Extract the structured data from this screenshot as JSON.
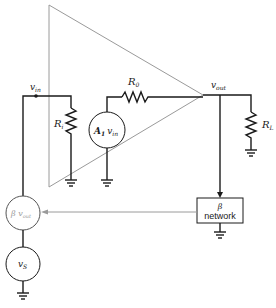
{
  "diagram": {
    "type": "feedback-amplifier-circuit",
    "colors": {
      "wire": "#1a1a1a",
      "amplifier_outline": "#9a9a9a",
      "feedback_path": "#9a9a9a"
    },
    "labels": {
      "v_in": "v",
      "v_in_sub": "in",
      "v_out": "v",
      "v_out_sub": "out",
      "R_i": "R",
      "R_i_sub": "i",
      "R_0": "R",
      "R_0_sub": "0",
      "R_L": "R",
      "R_L_sub": "L",
      "A1": "A",
      "A1_sub": "1",
      "A1_v": "v",
      "A1_v_sub": "in",
      "beta_src": "β v",
      "beta_src_sub": "out",
      "v_s": "v",
      "v_s_sub": "S",
      "beta_box_line1": "β",
      "beta_box_line2": "network"
    },
    "components": [
      {
        "id": "amplifier",
        "kind": "triangle"
      },
      {
        "id": "R_i",
        "kind": "resistor",
        "label": "Ri"
      },
      {
        "id": "R_0",
        "kind": "resistor",
        "label": "R0"
      },
      {
        "id": "R_L",
        "kind": "resistor",
        "label": "RL"
      },
      {
        "id": "A1_vin",
        "kind": "dependent-voltage-source",
        "label": "A1 vin"
      },
      {
        "id": "beta_vout",
        "kind": "dependent-voltage-source",
        "label": "β vout"
      },
      {
        "id": "v_S",
        "kind": "voltage-source",
        "label": "vS"
      },
      {
        "id": "beta_network",
        "kind": "block",
        "label": "β network"
      }
    ]
  }
}
